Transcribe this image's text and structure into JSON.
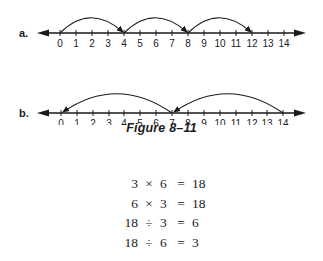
{
  "figure": {
    "caption": "Figure 8–11",
    "number_lines": [
      {
        "label": "a.",
        "ticks": [
          "0",
          "1",
          "2",
          "3",
          "4",
          "5",
          "6",
          "7",
          "8",
          "9",
          "10",
          "11",
          "12",
          "13",
          "14"
        ],
        "jumps": [
          {
            "from": 0,
            "to": 4
          },
          {
            "from": 4,
            "to": 8
          },
          {
            "from": 8,
            "to": 12
          }
        ],
        "direction": "right"
      },
      {
        "label": "b.",
        "ticks": [
          "0",
          "1",
          "2",
          "3",
          "4",
          "5",
          "6",
          "7",
          "8",
          "9",
          "10",
          "11",
          "12",
          "13",
          "14"
        ],
        "jumps": [
          {
            "from": 14,
            "to": 7
          },
          {
            "from": 7,
            "to": 0
          }
        ],
        "direction": "left"
      }
    ]
  },
  "equations": [
    {
      "a": "3",
      "op": "×",
      "b": "6",
      "eq": "=",
      "result": "18"
    },
    {
      "a": "6",
      "op": "×",
      "b": "3",
      "eq": "=",
      "result": "18"
    },
    {
      "a": "18",
      "op": "÷",
      "b": "3",
      "eq": "=",
      "result": "6"
    },
    {
      "a": "18",
      "op": "÷",
      "b": "6",
      "eq": "=",
      "result": "3"
    }
  ],
  "colors": {
    "ink": "#1a1a1a",
    "background": "#ffffff"
  }
}
